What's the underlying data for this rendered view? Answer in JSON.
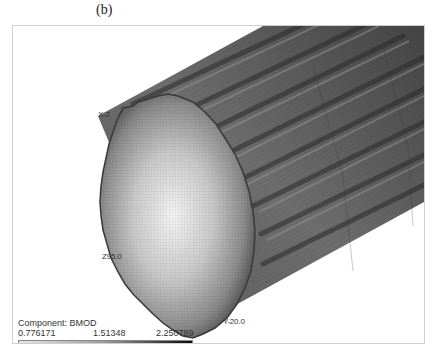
{
  "figure": {
    "caption": "(b)"
  },
  "view": {
    "axis_labels": {
      "x": "X-2",
      "z": "Z95.0",
      "y": "Y-20.0"
    },
    "colors": {
      "face_center": "#f2f2f2",
      "face_edge": "#4a4a4a",
      "body_dark": "#3c3c3c",
      "body_mid": "#6a6a6a",
      "frame": "#cfcfcf"
    }
  },
  "legend": {
    "title": "Component: BMOD",
    "min": "0.776171",
    "mid": "1.51348",
    "max": "2.250789",
    "gradient_start": "#e6e6e6",
    "gradient_end": "#0a0a0a"
  }
}
